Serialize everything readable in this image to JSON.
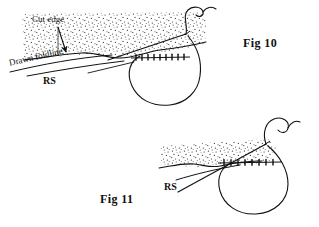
{
  "page": {
    "width": 319,
    "height": 227,
    "background_color": "#ffffff",
    "ink_color": "#111111"
  },
  "figures": [
    {
      "id": "fig-10",
      "label": "Fig 10",
      "annotations": [
        {
          "name": "cut-edge",
          "text": "Cut edge"
        },
        {
          "name": "drawn-foldline",
          "text": "Drawn foldline"
        },
        {
          "name": "right-side",
          "text": "RS"
        }
      ]
    },
    {
      "id": "fig-11",
      "label": "Fig 11",
      "annotations": [
        {
          "name": "right-side",
          "text": "RS"
        }
      ]
    }
  ],
  "fig10": {
    "label": "Fig 10",
    "cut_edge_label": "Cut edge",
    "foldline_label": "Drawn foldline",
    "rs_label": "RS"
  },
  "fig11": {
    "label": "Fig 11",
    "rs_label": "RS"
  },
  "colors": {
    "ink": "#111111",
    "stipple": "#333333",
    "paper": "#ffffff"
  }
}
